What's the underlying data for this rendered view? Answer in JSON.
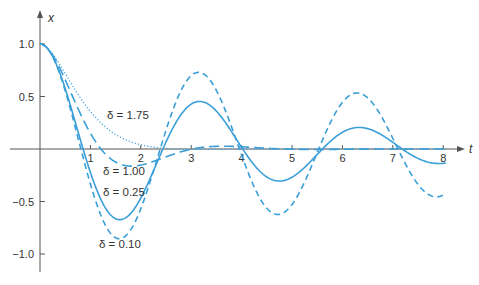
{
  "chart_data": {
    "type": "line",
    "title": "",
    "xlabel": "t",
    "ylabel": "x",
    "xlim": [
      0,
      8
    ],
    "ylim": [
      -1.0,
      1.0
    ],
    "grid": false,
    "legend": "inline labels",
    "x_ticks": [
      "1",
      "2",
      "3",
      "4",
      "5",
      "6",
      "7",
      "8"
    ],
    "y_ticks": [
      "1.0",
      "0.5",
      "−0.5",
      "−1.0"
    ],
    "y_tick_values": [
      1.0,
      0.5,
      -0.5,
      -1.0
    ],
    "model": "x'' + 2δx' + 4x = 0, x(0)=1, x'(0)=0",
    "series": [
      {
        "name": "δ = 1.75",
        "delta": 1.75,
        "style": "dotted",
        "x": [
          0,
          0.5,
          1,
          1.5,
          2,
          2.5,
          3,
          4,
          5,
          6,
          7,
          8
        ],
        "values": [
          1.0,
          0.81,
          0.5,
          0.25,
          0.08,
          0.0,
          -0.02,
          -0.01,
          0.0,
          0.0,
          0.0,
          0.0
        ],
        "label_pos": [
          107,
          119
        ]
      },
      {
        "name": "δ = 1.00",
        "delta": 1.0,
        "style": "long-dash",
        "x": [
          0,
          0.5,
          1,
          1.5,
          2,
          2.5,
          3,
          4,
          5,
          6,
          7,
          8
        ],
        "values": [
          1.0,
          0.72,
          0.23,
          -0.09,
          -0.16,
          -0.1,
          -0.03,
          0.02,
          0.0,
          0.0,
          0.0,
          0.0
        ],
        "label_pos": [
          103,
          175
        ]
      },
      {
        "name": "δ = 0.25",
        "delta": 0.25,
        "style": "solid",
        "x": [
          0,
          0.5,
          1,
          1.5,
          2,
          2.5,
          3,
          3.2,
          4,
          4.8,
          5.5,
          6.4,
          7,
          8
        ],
        "values": [
          1.0,
          0.58,
          -0.26,
          -0.65,
          -0.47,
          0.08,
          0.41,
          0.42,
          0.0,
          -0.3,
          -0.1,
          0.15,
          0.04,
          -0.2
        ],
        "label_pos": [
          103,
          196
        ]
      },
      {
        "name": "δ = 0.10",
        "delta": 0.1,
        "style": "dashed",
        "x": [
          0,
          0.5,
          1,
          1.5,
          2,
          2.5,
          3,
          3.2,
          4,
          4.8,
          5.5,
          6.4,
          7,
          8
        ],
        "values": [
          1.0,
          0.55,
          -0.37,
          -0.85,
          -0.62,
          0.15,
          0.68,
          0.7,
          0.0,
          -0.65,
          -0.2,
          0.48,
          0.07,
          -0.5
        ],
        "label_pos": [
          99,
          248
        ]
      }
    ]
  },
  "style": {
    "curve_color": "#3a9fd8",
    "axis_color": "#555555"
  }
}
